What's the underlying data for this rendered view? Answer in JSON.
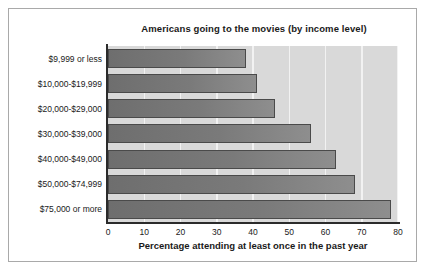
{
  "chart_data": {
    "type": "bar",
    "orientation": "horizontal",
    "title": "Americans going to the movies (by income level)",
    "xlabel": "Percentage attending at least once in the past year",
    "ylabel": "",
    "categories": [
      "$9,999 or less",
      "$10,000-$19,999",
      "$20,000-$29,000",
      "$30,000-$39,000",
      "$40,000-$49,000",
      "$50,000-$74,999",
      "$75,000 or more"
    ],
    "values": [
      38,
      41,
      46,
      56,
      63,
      68,
      78
    ],
    "xlim": [
      0,
      80
    ],
    "xticks": [
      0,
      10,
      20,
      30,
      40,
      50,
      60,
      70,
      80
    ],
    "xtick_labels": [
      "0",
      "10",
      "20",
      "30",
      "40",
      "50",
      "60",
      "70",
      "80"
    ],
    "grid": "vertical",
    "legend": null,
    "colors": {
      "bar_fill_dark": "#6e6e6e",
      "bar_fill_light": "#8e8e8e",
      "bar_border": "#4a4a4a",
      "plot_background": "#d9d9d9",
      "gridline": "#f2f2f2",
      "axis": "#2b2b2b",
      "text": "#1a1a1a",
      "page_background": "#ffffff",
      "frame_border": "#a9a9a9"
    }
  }
}
